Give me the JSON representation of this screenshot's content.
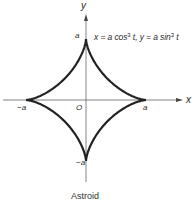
{
  "figure": {
    "caption": "Astroid",
    "equation": {
      "x_part": "x = a cos",
      "x_exp": "3",
      "x_var": " t, ",
      "y_part": "y = a sin",
      "y_exp": "3",
      "y_var": " t"
    },
    "axes": {
      "x_label": "x",
      "y_label": "y",
      "origin_label": "O"
    },
    "ticks": {
      "x_pos": "a",
      "x_neg": "−a",
      "y_pos": "a",
      "y_neg": "−a"
    },
    "colors": {
      "curve": "#222222",
      "axis": "#555555",
      "text": "#2a2a2a"
    }
  },
  "chart_data": {
    "type": "line",
    "title": "Astroid",
    "equation": "x = a cos^3 t, y = a sin^3 t",
    "xlabel": "x",
    "ylabel": "y",
    "x_ticks": [
      "-a",
      "O",
      "a"
    ],
    "y_ticks": [
      "-a",
      "a"
    ],
    "xlim": [
      "-a",
      "a"
    ],
    "ylim": [
      "-a",
      "a"
    ],
    "cusps": [
      [
        "a",
        0
      ],
      [
        0,
        "a"
      ],
      [
        "-a",
        0
      ],
      [
        0,
        "-a"
      ]
    ],
    "grid": false,
    "legend": null
  }
}
